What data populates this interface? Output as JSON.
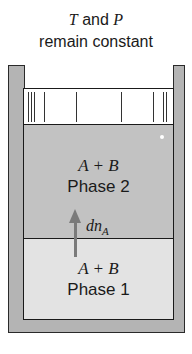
{
  "title": {
    "line1_var1": "T",
    "line1_mid": " and ",
    "line1_var2": "P",
    "line2": "remain constant"
  },
  "phase2": {
    "species": "A + B",
    "label": "Phase 2"
  },
  "phase1": {
    "species": "A + B",
    "label": "Phase 1"
  },
  "transfer": {
    "symbol": "dn",
    "subscript": "A",
    "direction": "up"
  },
  "colors": {
    "phase1": "#e3e3e3",
    "phase2": "#c2c2c2",
    "walls": "#b4b4b4",
    "arrow": "#7a7a7a"
  }
}
